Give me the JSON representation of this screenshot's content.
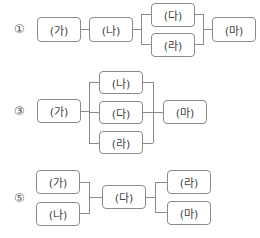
{
  "diagrams": [
    {
      "label": "①",
      "boxes": {
        "ga": "(가)",
        "na": "(나)",
        "da": "(다)",
        "ra": "(라)",
        "ma": "(마)"
      }
    },
    {
      "label": "③",
      "boxes": {
        "ga": "(가)",
        "na": "(나)",
        "da": "(다)",
        "ra": "(라)",
        "ma": "(마)"
      }
    },
    {
      "label": "⑤",
      "boxes": {
        "ga": "(가)",
        "na": "(나)",
        "da": "(다)",
        "ra": "(라)",
        "ma": "(마)"
      }
    }
  ],
  "colors": {
    "line": "#8a8a8a",
    "text": "#444444",
    "background": "#ffffff"
  }
}
